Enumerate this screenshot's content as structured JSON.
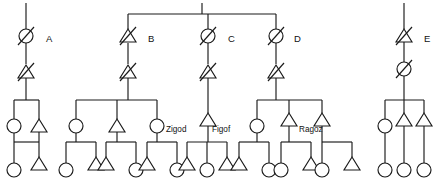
{
  "diagram": {
    "type": "pedigree-chart",
    "title": "",
    "width": 441,
    "height": 186,
    "background_color": "#ffffff",
    "line_color": "#1a1a1a",
    "symbol_fill": "#ffffff",
    "legend_note": "circle = female, triangle = male, slash = deceased",
    "generation_labels": [
      {
        "id": "A",
        "text": "A",
        "x": 46,
        "y": 39
      },
      {
        "id": "B",
        "text": "B",
        "x": 148,
        "y": 39
      },
      {
        "id": "C",
        "text": "C",
        "x": 228,
        "y": 39
      },
      {
        "id": "D",
        "text": "D",
        "x": 294,
        "y": 39
      },
      {
        "id": "E",
        "text": "E",
        "x": 424,
        "y": 39
      }
    ],
    "name_labels": [
      {
        "id": "zigod",
        "text": "Zigod",
        "x": 166,
        "y": 129
      },
      {
        "id": "figof",
        "text": "Figof",
        "x": 212,
        "y": 129
      },
      {
        "id": "ragoz",
        "text": "Ragoz",
        "x": 303,
        "y": 129
      }
    ],
    "founder_stacks": [
      {
        "id": "A",
        "x": 26,
        "top_symbol": "circle-slashed",
        "bottom_symbol": "triangle-slashed",
        "label": "A"
      },
      {
        "id": "B",
        "x": 128,
        "top_symbol": "triangle-slashed",
        "bottom_symbol": "triangle-slashed",
        "label": "B"
      },
      {
        "id": "C",
        "x": 208,
        "top_symbol": "circle-slashed",
        "bottom_symbol": "triangle-slashed",
        "label": "C"
      },
      {
        "id": "D",
        "x": 276,
        "top_symbol": "circle-slashed",
        "bottom_symbol": "triangle-slashed",
        "label": "D"
      },
      {
        "id": "E",
        "x": 404,
        "top_symbol": "triangle-slashed",
        "bottom_symbol": "circle-slashed",
        "label": "E"
      }
    ],
    "sibship_bars": [
      {
        "id": "bar-top-BCD",
        "x1": 128,
        "x2": 276,
        "y": 14,
        "children_x": [
          128,
          208,
          276
        ]
      },
      {
        "id": "bar-A-children",
        "x1": 14,
        "x2": 39,
        "y": 100,
        "children_x": [
          14,
          39
        ]
      },
      {
        "id": "bar-B-children",
        "x1": 76,
        "x2": 157,
        "y": 100,
        "children_x": [
          76,
          117,
          157
        ]
      },
      {
        "id": "bar-C-children",
        "x1": 208,
        "x2": 208,
        "y": 100,
        "children_x": [
          208
        ]
      },
      {
        "id": "bar-D-children",
        "x1": 257,
        "x2": 322,
        "y": 100,
        "children_x": [
          257,
          289,
          322
        ]
      },
      {
        "id": "bar-E-children",
        "x1": 385,
        "x2": 424,
        "y": 100,
        "children_x": [
          385,
          404,
          424
        ]
      },
      {
        "id": "bar-g3-1",
        "x1": 14,
        "x2": 39,
        "y": 142,
        "children_x": [
          14,
          39
        ]
      },
      {
        "id": "bar-g3-2",
        "x1": 66,
        "x2": 96,
        "y": 142,
        "children_x": [
          66,
          96
        ]
      },
      {
        "id": "bar-g3-3",
        "x1": 106,
        "x2": 136,
        "y": 142,
        "children_x": [
          106,
          136
        ]
      },
      {
        "id": "bar-g3-4",
        "x1": 147,
        "x2": 177,
        "y": 142,
        "children_x": [
          147,
          177
        ]
      },
      {
        "id": "bar-g3-5",
        "x1": 187,
        "x2": 227,
        "y": 142,
        "children_x": [
          187,
          207,
          227
        ]
      },
      {
        "id": "bar-g3-6",
        "x1": 239,
        "x2": 269,
        "y": 142,
        "children_x": [
          239,
          269
        ]
      },
      {
        "id": "bar-g3-7",
        "x1": 281,
        "x2": 311,
        "y": 142,
        "children_x": [
          281,
          311
        ]
      },
      {
        "id": "bar-g3-8",
        "x1": 322,
        "x2": 352,
        "y": 142,
        "children_x": [
          322,
          352
        ]
      }
    ],
    "generation2": [
      {
        "id": "g2-a1",
        "x": 14,
        "shape": "circle",
        "name": ""
      },
      {
        "id": "g2-a2",
        "x": 39,
        "shape": "triangle",
        "name": ""
      },
      {
        "id": "g2-b1",
        "x": 76,
        "shape": "circle",
        "name": ""
      },
      {
        "id": "g2-b2",
        "x": 117,
        "shape": "triangle",
        "name": ""
      },
      {
        "id": "g2-b3",
        "x": 157,
        "shape": "circle",
        "name": "Zigod"
      },
      {
        "id": "g2-c1",
        "x": 208,
        "shape": "triangle",
        "name": "Figof"
      },
      {
        "id": "g2-d1",
        "x": 257,
        "shape": "circle",
        "name": ""
      },
      {
        "id": "g2-d2",
        "x": 289,
        "shape": "triangle",
        "name": "Ragoz"
      },
      {
        "id": "g2-d3",
        "x": 322,
        "shape": "triangle",
        "name": ""
      },
      {
        "id": "g2-e1",
        "x": 385,
        "shape": "circle",
        "name": ""
      },
      {
        "id": "g2-e2",
        "x": 404,
        "shape": "triangle",
        "name": ""
      },
      {
        "id": "g2-e3",
        "x": 424,
        "shape": "triangle",
        "name": ""
      }
    ],
    "generation3": [
      {
        "id": "g3-1",
        "x": 14,
        "shape": "circle"
      },
      {
        "id": "g3-2",
        "x": 39,
        "shape": "triangle"
      },
      {
        "id": "g3-3",
        "x": 66,
        "shape": "circle"
      },
      {
        "id": "g3-4",
        "x": 96,
        "shape": "triangle"
      },
      {
        "id": "g3-5",
        "x": 106,
        "shape": "triangle"
      },
      {
        "id": "g3-6",
        "x": 136,
        "shape": "circle"
      },
      {
        "id": "g3-7",
        "x": 147,
        "shape": "triangle"
      },
      {
        "id": "g3-8",
        "x": 177,
        "shape": "circle"
      },
      {
        "id": "g3-9",
        "x": 187,
        "shape": "triangle"
      },
      {
        "id": "g3-10",
        "x": 207,
        "shape": "circle"
      },
      {
        "id": "g3-11",
        "x": 227,
        "shape": "triangle"
      },
      {
        "id": "g3-12",
        "x": 239,
        "shape": "triangle"
      },
      {
        "id": "g3-13",
        "x": 269,
        "shape": "circle"
      },
      {
        "id": "g3-14",
        "x": 281,
        "shape": "circle"
      },
      {
        "id": "g3-15",
        "x": 311,
        "shape": "triangle"
      },
      {
        "id": "g3-16",
        "x": 322,
        "shape": "circle"
      },
      {
        "id": "g3-17",
        "x": 352,
        "shape": "triangle"
      },
      {
        "id": "g3-18",
        "x": 385,
        "shape": "circle"
      },
      {
        "id": "g3-19",
        "x": 404,
        "shape": "circle"
      },
      {
        "id": "g3-20",
        "x": 424,
        "shape": "circle"
      }
    ],
    "geometry": {
      "top_bar_y": 14,
      "founder_top_y": 36,
      "founder_bottom_y": 72,
      "founder_stem_top_y": 3,
      "gen2_bar_y": 100,
      "gen2_symbol_y": 126,
      "gen3_bar_y": 142,
      "gen3_symbol_y": 170,
      "symbol_radius": 7,
      "triangle_half_width": 8,
      "triangle_height": 13
    }
  }
}
